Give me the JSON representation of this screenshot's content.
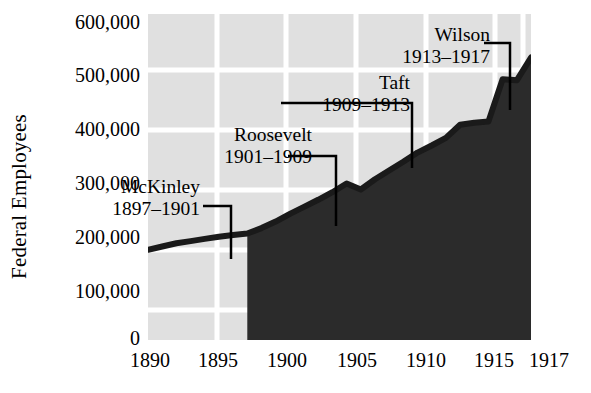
{
  "chart_data": {
    "type": "area",
    "title": "",
    "xlabel": "",
    "ylabel": "Federal Employees",
    "xlim": [
      1890,
      1917
    ],
    "ylim": [
      0,
      600000
    ],
    "grid": true,
    "legend": "none",
    "x_ticks": [
      "1890",
      "1895",
      "1900",
      "1905",
      "1910",
      "1915",
      "1917"
    ],
    "x_tick_values": [
      1890,
      1895,
      1900,
      1905,
      1910,
      1915,
      1917
    ],
    "y_ticks": [
      "0",
      "100,000",
      "200,000",
      "300,000",
      "400,000",
      "500,000",
      "600,000"
    ],
    "y_tick_values": [
      0,
      100000,
      200000,
      300000,
      400000,
      500000,
      600000
    ],
    "series": [
      {
        "name": "Federal Employees",
        "x": [
          1890,
          1891,
          1892,
          1893,
          1894,
          1895,
          1896,
          1897,
          1898,
          1899,
          1900,
          1901,
          1902,
          1903,
          1904,
          1905,
          1906,
          1907,
          1908,
          1909,
          1910,
          1911,
          1912,
          1913,
          1914,
          1915,
          1916,
          1917
        ],
        "values": [
          166000,
          172000,
          178000,
          182000,
          186000,
          190000,
          193000,
          196000,
          206000,
          218000,
          232000,
          245000,
          258000,
          272000,
          288000,
          277000,
          296000,
          312000,
          328000,
          345000,
          358000,
          372000,
          396000,
          400000,
          402000,
          480000,
          478000,
          520000
        ]
      }
    ],
    "annotations": [
      {
        "id": "mckinley",
        "name": "McKinley",
        "years": "1897–1901",
        "term_start": 1897,
        "term_end": 1901
      },
      {
        "id": "roosevelt",
        "name": "Roosevelt",
        "years": "1901–1909",
        "term_start": 1901,
        "term_end": 1909
      },
      {
        "id": "taft",
        "name": "Taft",
        "years": "1909–1913",
        "term_start": 1909,
        "term_end": 1913
      },
      {
        "id": "wilson",
        "name": "Wilson",
        "years": "1913–1917",
        "term_start": 1913,
        "term_end": 1917
      }
    ],
    "colors": {
      "plot_background": "#e0e0e0",
      "gridline": "#ffffff",
      "area_fill": "#2b2b2b",
      "line": "#1a1a1a",
      "text": "#000000",
      "page_background": "#ffffff"
    }
  }
}
